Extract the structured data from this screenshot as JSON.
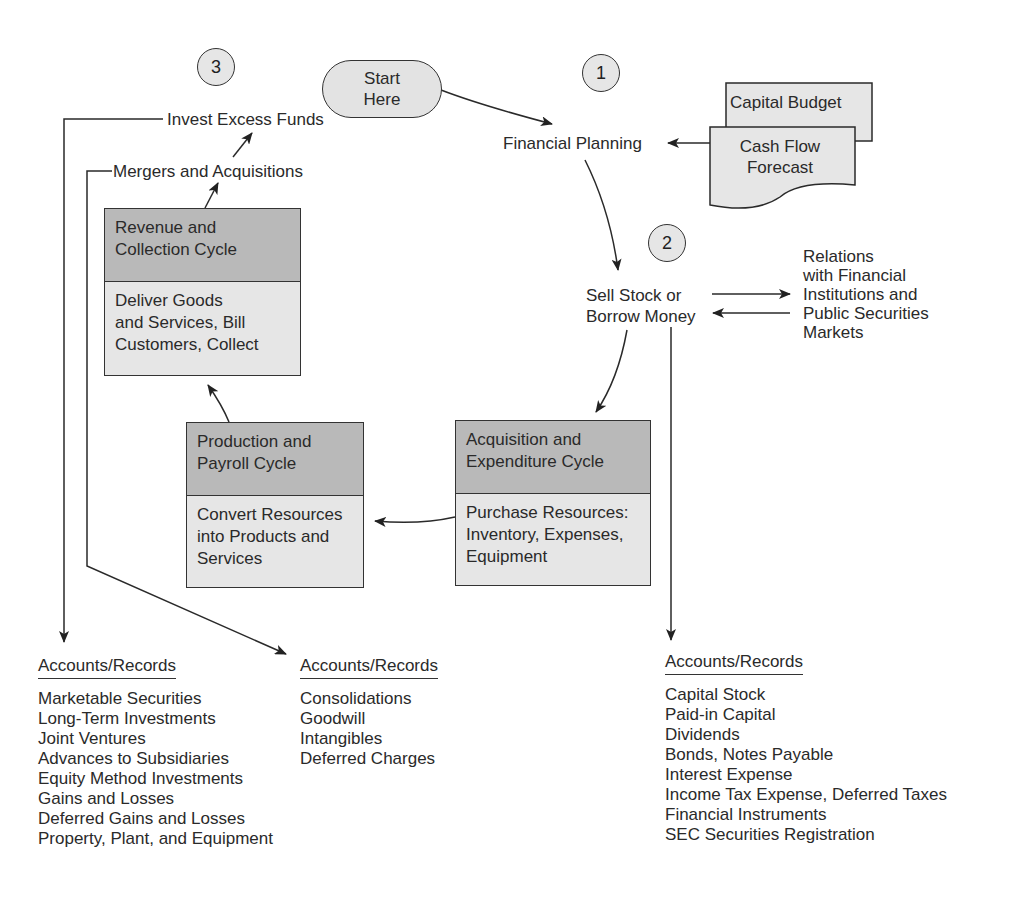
{
  "start": {
    "line1": "Start",
    "line2": "Here"
  },
  "steps": [
    {
      "number": "1"
    },
    {
      "number": "2"
    },
    {
      "number": "3"
    }
  ],
  "labels": {
    "financial_planning": "Financial Planning",
    "sell_stock_line1": "Sell Stock or",
    "sell_stock_line2": "Borrow Money",
    "invest_excess_funds": "Invest Excess Funds",
    "mergers_acquisitions": "Mergers and Acquisitions",
    "relations": [
      "Relations",
      "with Financial",
      "Institutions and",
      "Public Securities",
      "Markets"
    ]
  },
  "documents": {
    "capital_budget": "Capital Budget",
    "cash_flow_line1": "Cash Flow",
    "cash_flow_line2": "Forecast"
  },
  "cycles": {
    "revenue": {
      "title": [
        "Revenue and",
        "Collection Cycle"
      ],
      "body": [
        "Deliver Goods",
        "and Services, Bill",
        "Customers, Collect"
      ]
    },
    "production": {
      "title": [
        "Production and",
        "Payroll Cycle"
      ],
      "body": [
        "Convert Resources",
        "into Products and",
        "Services"
      ]
    },
    "acquisition": {
      "title": [
        "Acquisition and",
        "Expenditure Cycle"
      ],
      "body": [
        "Purchase Resources:",
        "Inventory, Expenses,",
        "Equipment"
      ]
    }
  },
  "accounts": {
    "invest": {
      "title": "Accounts/Records",
      "items": [
        "Marketable Securities",
        "Long-Term Investments",
        "Joint Ventures",
        "Advances to Subsidiaries",
        "Equity Method Investments",
        "Gains and Losses",
        "Deferred Gains and Losses",
        "Property, Plant, and Equipment"
      ]
    },
    "mergers": {
      "title": "Accounts/Records",
      "items": [
        "Consolidations",
        "Goodwill",
        "Intangibles",
        "Deferred Charges"
      ]
    },
    "financing": {
      "title": "Accounts/Records",
      "items": [
        "Capital Stock",
        "Paid-in Capital",
        "Dividends",
        "Bonds, Notes Payable",
        "Interest Expense",
        "Income Tax Expense, Deferred Taxes",
        "Financial Instruments",
        "SEC Securities Registration"
      ]
    }
  },
  "colors": {
    "line": "#2a2a2a",
    "box_fill": "#e6e6e6",
    "box_header": "#b9b9b9"
  }
}
